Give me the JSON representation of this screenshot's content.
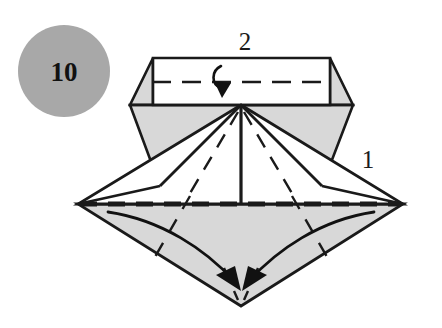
{
  "figure": {
    "type": "origami-step-diagram",
    "canvas": {
      "width": 442,
      "height": 328,
      "background": "#ffffff"
    }
  },
  "step_badge": {
    "name": "step-number-badge",
    "label": "10",
    "shape": "circle",
    "fill": "#a8a8a8",
    "text_color": "#111111",
    "center": {
      "x": 64,
      "y": 71
    },
    "radius": 46
  },
  "reference_labels": [
    {
      "name": "fold-reference-2",
      "label": "2",
      "x": 245,
      "y": 50,
      "description": "label above the top rectangular flap fold"
    },
    {
      "name": "fold-reference-1",
      "label": "1",
      "x": 368,
      "y": 168,
      "description": "label near the right edge of the wide diamond"
    }
  ],
  "colors": {
    "paper_front": "#ffffff",
    "paper_back": "#d8d8d8",
    "paper_back_light": "#dedede",
    "outline": "#1a1a1a",
    "fold_line": "#1a1a1a",
    "badge_fill": "#a8a8a8",
    "badge_text": "#111111"
  },
  "geometry": {
    "top_rect": {
      "name": "top-rectangle-flap",
      "points": "153,58 330,58 330,105 153,105"
    },
    "top_left_triangle": {
      "name": "top-left-corner-triangle",
      "points": "153,58 153,105 130,105"
    },
    "top_right_triangle": {
      "name": "top-right-corner-triangle",
      "points": "330,58 353,105 330,105"
    },
    "hex_left_panel": {
      "name": "hexagon-left-panel",
      "points": "130,105 241,105 160,186"
    },
    "hex_right_panel": {
      "name": "hexagon-right-panel",
      "points": "353,105 322,186 241,105"
    },
    "left_white_wing": {
      "name": "left-white-wing",
      "points": "241,105 78,204 160,186"
    },
    "right_white_wing": {
      "name": "right-white-wing",
      "points": "241,105 322,186 403,204"
    },
    "center_white_triangle": {
      "name": "center-white-triangle",
      "points": "241,105 78,204 403,204"
    },
    "lower_diamond": {
      "name": "lower-gray-diamond",
      "points": "78,204 403,204 241,306"
    },
    "center_vertical_fold": {
      "name": "center-vertical-fold-line",
      "x1": 241,
      "y1": 105,
      "x2": 241,
      "y2": 204
    }
  },
  "fold_lines": {
    "top_dashed": {
      "name": "top-valley-fold-dashed",
      "x1": 152,
      "y1": 82,
      "x2": 332,
      "y2": 82,
      "style": "dashed"
    },
    "middle_dashed": {
      "name": "middle-valley-fold-dashed",
      "x1": 80,
      "y1": 204,
      "x2": 401,
      "y2": 204,
      "style": "dashed-thick"
    },
    "fan_left": {
      "name": "fan-fold-left-dashed",
      "x1": 238,
      "y1": 112,
      "x2": 186,
      "y2": 200
    },
    "fan_right": {
      "name": "fan-fold-right-dashed",
      "x1": 244,
      "y1": 112,
      "x2": 296,
      "y2": 200
    },
    "lower_left_dashed": {
      "name": "lower-left-fold-dashed",
      "x1": 190,
      "y1": 196,
      "x2": 152,
      "y2": 262
    },
    "lower_right_dashed": {
      "name": "lower-right-fold-dashed",
      "x1": 292,
      "y1": 196,
      "x2": 330,
      "y2": 262
    },
    "bottom_center_left_dashed": {
      "name": "bottom-center-left-dashed",
      "x1": 224,
      "y1": 270,
      "x2": 238,
      "y2": 300
    },
    "bottom_center_right_dashed": {
      "name": "bottom-center-right-dashed",
      "x1": 258,
      "y1": 270,
      "x2": 244,
      "y2": 300
    }
  },
  "arrows": [
    {
      "name": "fold-arrow-top-down",
      "type": "hook-arrow",
      "direction": "down",
      "description": "small hooked arrow folding the top rectangle flap downward",
      "path": "M 220 67 C 212 73, 214 84, 222 88",
      "head": "222,97 214,83 232,84"
    },
    {
      "name": "fold-arrow-left-sweep",
      "type": "curved-arrow",
      "direction": "down-right",
      "description": "left curved arrow sweeping the left flap toward bottom center",
      "path": "M 110 211 C 160 219, 205 248, 236 283",
      "head": "240,290 219,276 236,268"
    },
    {
      "name": "fold-arrow-right-sweep",
      "type": "curved-arrow",
      "direction": "down-left",
      "description": "right curved arrow sweeping the right flap toward bottom center",
      "path": "M 372 211 C 322 219, 278 248, 248 283",
      "head": "244,290 248,268, 265,276"
    }
  ]
}
